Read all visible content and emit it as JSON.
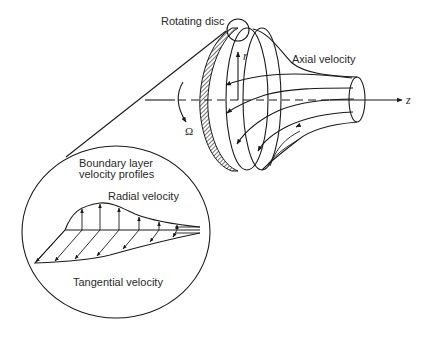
{
  "figure": {
    "type": "diagram"
  },
  "labels": {
    "rotating_disc": "Rotating disc",
    "axial_velocity": "Axial velocity",
    "r_axis": "r",
    "z_axis": "z",
    "omega": "Ω",
    "boundary_layer_line1": "Boundary layer",
    "boundary_layer_line2": "velocity profiles",
    "radial_velocity": "Radial velocity",
    "tangential_velocity": "Tangential velocity"
  },
  "colors": {
    "stroke": "#1a1a1a",
    "text": "#2a2a2a",
    "background": "#ffffff"
  },
  "inset": {
    "radial_arrow_count": 6,
    "tangential_arrow_count": 7
  }
}
